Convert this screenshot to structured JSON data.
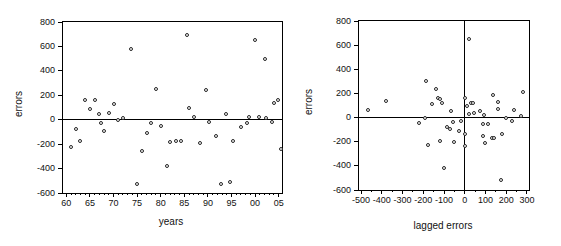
{
  "figure": {
    "background": "#ffffff",
    "axis_color": "#000000",
    "dot_border_color": "#262626"
  },
  "chart_data": [
    {
      "type": "scatter",
      "title": "",
      "xlabel": "years",
      "ylabel": "errors",
      "xlim": [
        59.3,
        105.7
      ],
      "ylim": [
        -600,
        800
      ],
      "grid": false,
      "legend": null,
      "zero_hline": true,
      "zero_vline": false,
      "x_minor_step": 1,
      "x_ticks": {
        "values": [
          60,
          65,
          70,
          75,
          80,
          85,
          90,
          95,
          100,
          105
        ],
        "labels": [
          "60",
          "65",
          "70",
          "75",
          "80",
          "85",
          "90",
          "95",
          "00",
          "05"
        ]
      },
      "y_ticks": {
        "values": [
          800,
          600,
          400,
          200,
          0,
          -200,
          -400,
          -600
        ],
        "labels": [
          "800",
          "600",
          "400",
          "200",
          "0",
          "-200",
          "-400",
          "-600"
        ]
      },
      "points": [
        [
          61,
          -225
        ],
        [
          62,
          -80
        ],
        [
          63,
          -175
        ],
        [
          64,
          165
        ],
        [
          65,
          90
        ],
        [
          66,
          165
        ],
        [
          67,
          50
        ],
        [
          67.3,
          -25
        ],
        [
          68,
          -90
        ],
        [
          69,
          55
        ],
        [
          70,
          125
        ],
        [
          71,
          0
        ],
        [
          72,
          15
        ],
        [
          73.7,
          580
        ],
        [
          75,
          -530
        ],
        [
          76,
          -260
        ],
        [
          77,
          -110
        ],
        [
          78,
          -25
        ],
        [
          79,
          255
        ],
        [
          80,
          -55
        ],
        [
          81.3,
          -375
        ],
        [
          82,
          -180
        ],
        [
          83.3,
          -175
        ],
        [
          84.2,
          -175
        ],
        [
          85.5,
          695
        ],
        [
          86,
          100
        ],
        [
          87,
          20
        ],
        [
          88.3,
          -190
        ],
        [
          89.5,
          245
        ],
        [
          90.3,
          -15
        ],
        [
          91.8,
          -135
        ],
        [
          92.8,
          -525
        ],
        [
          93.8,
          45
        ],
        [
          94.7,
          -510
        ],
        [
          95.3,
          -175
        ],
        [
          97,
          -60
        ],
        [
          98.2,
          -25
        ],
        [
          98.7,
          25
        ],
        [
          100,
          655
        ],
        [
          100.9,
          20
        ],
        [
          102,
          495
        ],
        [
          102.4,
          10
        ],
        [
          103.5,
          -20
        ],
        [
          103.9,
          135
        ],
        [
          104.8,
          160
        ],
        [
          105.4,
          -240
        ]
      ]
    },
    {
      "type": "scatter",
      "title": "",
      "xlabel": "lagged errors",
      "ylabel": "errors",
      "xlim": [
        -510,
        310
      ],
      "ylim": [
        -600,
        800
      ],
      "grid": false,
      "legend": null,
      "zero_hline": true,
      "zero_vline": true,
      "x_minor_step": 50,
      "x_ticks": {
        "values": [
          -500,
          -400,
          -300,
          -200,
          -100,
          0,
          100,
          200,
          300
        ],
        "labels": [
          "-500",
          "-400",
          "-300",
          "-200",
          "-100",
          "0",
          "100",
          "200",
          "300"
        ]
      },
      "y_ticks": {
        "values": [
          800,
          600,
          400,
          200,
          0,
          -200,
          -400,
          -600
        ],
        "labels": [
          "800",
          "600",
          "400",
          "200",
          "0",
          "-200",
          "-400",
          "-600"
        ]
      },
      "points": [
        [
          -465,
          65
        ],
        [
          -380,
          140
        ],
        [
          -220,
          -45
        ],
        [
          -190,
          0
        ],
        [
          -185,
          300
        ],
        [
          -160,
          110
        ],
        [
          -140,
          240
        ],
        [
          -130,
          165
        ],
        [
          -120,
          155
        ],
        [
          -110,
          120
        ],
        [
          -175,
          -230
        ],
        [
          -120,
          -190
        ],
        [
          -100,
          -420
        ],
        [
          -85,
          -80
        ],
        [
          -70,
          -95
        ],
        [
          -65,
          55
        ],
        [
          -55,
          -40
        ],
        [
          -50,
          -200
        ],
        [
          -30,
          -115
        ],
        [
          -20,
          -30
        ],
        [
          0,
          -140
        ],
        [
          0,
          -235
        ],
        [
          0,
          160
        ],
        [
          10,
          95
        ],
        [
          20,
          650
        ],
        [
          30,
          120
        ],
        [
          40,
          120
        ],
        [
          20,
          30
        ],
        [
          45,
          35
        ],
        [
          75,
          55
        ],
        [
          95,
          25
        ],
        [
          90,
          -55
        ],
        [
          110,
          -55
        ],
        [
          100,
          -210
        ],
        [
          90,
          -150
        ],
        [
          130,
          -170
        ],
        [
          140,
          -170
        ],
        [
          135,
          185
        ],
        [
          160,
          130
        ],
        [
          160,
          75
        ],
        [
          180,
          -135
        ],
        [
          175,
          -520
        ],
        [
          200,
          0
        ],
        [
          230,
          -30
        ],
        [
          240,
          60
        ],
        [
          270,
          10
        ],
        [
          280,
          215
        ]
      ]
    }
  ]
}
